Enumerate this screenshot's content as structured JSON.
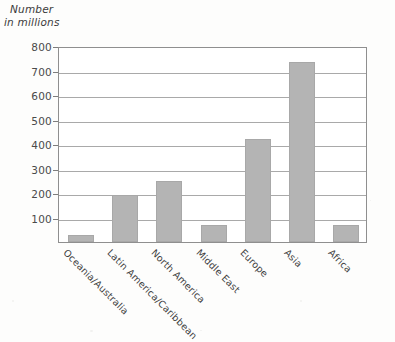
{
  "chart_data": {
    "type": "bar",
    "title": "Number in millions",
    "title_lines": [
      "Number",
      "in millions"
    ],
    "xlabel": "",
    "ylabel": "Number in millions",
    "categories": [
      "Oceania/Australia",
      "Latin America/Caribbean",
      "North America",
      "Middle East",
      "Europe",
      "Asia",
      "Africa"
    ],
    "values": [
      28,
      190,
      250,
      68,
      420,
      735,
      70
    ],
    "ylim": [
      0,
      800
    ],
    "yticks": [
      100,
      200,
      300,
      400,
      500,
      600,
      700,
      800
    ],
    "ytick_labels": [
      "100",
      "200",
      "300",
      "400",
      "500",
      "600",
      "700",
      "800"
    ],
    "grid": true,
    "legend": false,
    "bar_color": "#b4b4b4",
    "gridline_color": "#9a9a9a",
    "axis_color": "#8f8f8f",
    "text_color": "#3f3f3f",
    "background_color": "#fdfdfc"
  }
}
